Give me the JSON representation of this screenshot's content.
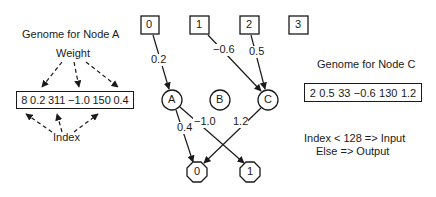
{
  "genome_a": {
    "title": "Genome for Node A",
    "weight_label": "Weight",
    "index_label": "Index",
    "values": [
      "8",
      "0.2",
      "311",
      "−1.0",
      "150",
      "0.4"
    ]
  },
  "genome_c": {
    "title": "Genome for Node C",
    "values": [
      "2",
      "0.5",
      "33",
      "−0.6",
      "130",
      "1.2"
    ]
  },
  "rule": {
    "line1": "Index < 128 => Input",
    "line2": "Else => Output"
  },
  "network": {
    "inputs": [
      {
        "id": "0",
        "x": 150,
        "y": 25
      },
      {
        "id": "1",
        "x": 199,
        "y": 25
      },
      {
        "id": "2",
        "x": 249,
        "y": 25
      },
      {
        "id": "3",
        "x": 298,
        "y": 25
      }
    ],
    "hidden": [
      {
        "id": "A",
        "x": 172,
        "y": 100
      },
      {
        "id": "B",
        "x": 220,
        "y": 100
      },
      {
        "id": "C",
        "x": 268,
        "y": 100
      }
    ],
    "outputs": [
      {
        "id": "0",
        "x": 197,
        "y": 172
      },
      {
        "id": "1",
        "x": 250,
        "y": 172
      }
    ],
    "edges": [
      {
        "from": "input-0",
        "to": "A",
        "weight": "0.2"
      },
      {
        "from": "input-1",
        "to": "C",
        "weight": "−0.6"
      },
      {
        "from": "input-2",
        "to": "C",
        "weight": "0.5"
      },
      {
        "from": "A",
        "to": "output-0",
        "weight": "0.4"
      },
      {
        "from": "A",
        "to": "output-1",
        "weight": "−1.0"
      },
      {
        "from": "C",
        "to": "output-0",
        "weight": "1.2"
      }
    ]
  }
}
